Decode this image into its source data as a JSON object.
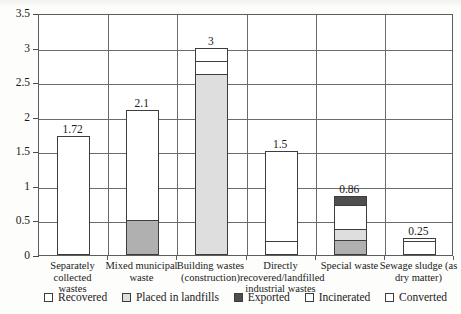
{
  "chart_data": {
    "type": "bar",
    "title": "",
    "subtitle": "",
    "xlabel": "",
    "ylabel": "",
    "ylim": [
      0,
      3.5
    ],
    "ytick_values": [
      "3.5",
      "3",
      "2.5",
      "2",
      "1.5",
      "1",
      "0.5",
      "0"
    ],
    "grid": true,
    "stacked": true,
    "legend_position": "bottom",
    "categories": [
      "Separately collected wastes",
      "Mixed municipal waste",
      "Building wastes (construction)",
      "Directly recovered/landfilled industrial wastes",
      "Special waste",
      "Sewage sludge (as dry matter)"
    ],
    "totals": [
      "1.72",
      "2.1",
      "3",
      "1.5",
      "0.86",
      "0.25"
    ],
    "total_values": [
      1.72,
      2.1,
      3.0,
      1.5,
      0.86,
      0.25
    ],
    "series": [
      {
        "name": "Recovered",
        "color": "#ffffff",
        "values": [
          1.72,
          1.6,
          0.0,
          1.3,
          0.34,
          0.05
        ]
      },
      {
        "name": "Placed in landfills",
        "color": "#b0b0b0",
        "values": [
          0.0,
          0.5,
          2.62,
          0.0,
          0.22,
          0.0
        ]
      },
      {
        "name": "Exported",
        "color": "#4e4e4e",
        "values": [
          0.0,
          0.0,
          0.0,
          0.0,
          0.14,
          0.0
        ]
      },
      {
        "name": "Incinerated",
        "color": "#ffffff",
        "values": [
          0.0,
          0.0,
          0.2,
          0.2,
          0.0,
          0.2
        ]
      },
      {
        "name": "Converted",
        "color": "#dedede",
        "values": [
          0.0,
          0.0,
          0.18,
          0.0,
          0.16,
          0.0
        ]
      }
    ],
    "bars": [
      {
        "category": "Separately collected wastes",
        "label_lines": [
          "Separately collected",
          "wastes"
        ],
        "total_label": "1.72",
        "total": 1.72,
        "segments": [
          {
            "series": "Recovered",
            "from": 0.0,
            "to": 1.72,
            "fill": "white"
          }
        ]
      },
      {
        "category": "Mixed municipal waste",
        "label_lines": [
          "Mixed municipal",
          "waste"
        ],
        "total_label": "2.1",
        "total": 2.1,
        "segments": [
          {
            "series": "Placed in landfills",
            "from": 0.0,
            "to": 0.5,
            "fill": "midgray"
          },
          {
            "series": "Recovered",
            "from": 0.5,
            "to": 2.1,
            "fill": "white"
          }
        ]
      },
      {
        "category": "Building wastes (construction)",
        "label_lines": [
          "Building wastes",
          "(construction)"
        ],
        "total_label": "3",
        "total": 3.0,
        "segments": [
          {
            "series": "Placed in landfills",
            "from": 0.0,
            "to": 2.62,
            "fill": "lightgray"
          },
          {
            "series": "Converted",
            "from": 2.62,
            "to": 2.8,
            "fill": "white"
          },
          {
            "series": "Incinerated",
            "from": 2.8,
            "to": 3.0,
            "fill": "white"
          }
        ]
      },
      {
        "category": "Directly recovered/landfilled industrial wastes",
        "label_lines": [
          "Directly",
          "recovered/landfilled",
          "industrial wastes"
        ],
        "total_label": "1.5",
        "total": 1.5,
        "segments": [
          {
            "series": "Incinerated",
            "from": 0.0,
            "to": 0.2,
            "fill": "white"
          },
          {
            "series": "Recovered",
            "from": 0.2,
            "to": 1.5,
            "fill": "white"
          }
        ]
      },
      {
        "category": "Special waste",
        "label_lines": [
          "Special waste"
        ],
        "total_label": "0.86",
        "total": 0.86,
        "segments": [
          {
            "series": "Placed in landfills",
            "from": 0.0,
            "to": 0.22,
            "fill": "midgray"
          },
          {
            "series": "Converted",
            "from": 0.22,
            "to": 0.38,
            "fill": "lightgray"
          },
          {
            "series": "Recovered",
            "from": 0.38,
            "to": 0.72,
            "fill": "white"
          },
          {
            "series": "Exported",
            "from": 0.72,
            "to": 0.86,
            "fill": "darkgray"
          }
        ]
      },
      {
        "category": "Sewage sludge (as dry matter)",
        "label_lines": [
          "Sewage sludge (as",
          "dry matter)"
        ],
        "total_label": "0.25",
        "total": 0.25,
        "segments": [
          {
            "series": "Incinerated",
            "from": 0.0,
            "to": 0.2,
            "fill": "white"
          },
          {
            "series": "Recovered",
            "from": 0.2,
            "to": 0.25,
            "fill": "white"
          }
        ]
      }
    ],
    "legend": [
      {
        "label": "Recovered",
        "fill": "white"
      },
      {
        "label": "Placed in landfills",
        "fill": "lightgray"
      },
      {
        "label": "Exported",
        "fill": "darkgray"
      },
      {
        "label": "Incinerated",
        "fill": "white"
      },
      {
        "label": "Converted",
        "fill": "white"
      }
    ],
    "colors": {
      "white": "#ffffff",
      "lightgray": "#dedede",
      "midgray": "#b0b0b0",
      "darkgray": "#4e4e4e",
      "axis": "#5d5d5d",
      "grid": "#6b6b6b",
      "text": "#1a1a1a"
    }
  }
}
